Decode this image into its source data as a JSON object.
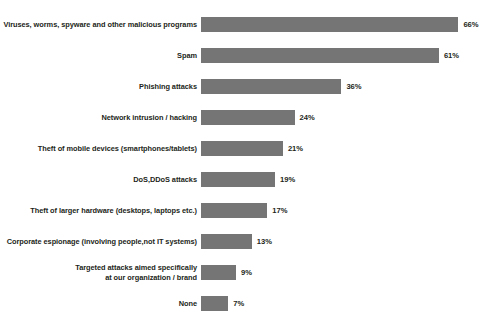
{
  "chart_data": {
    "type": "bar",
    "orientation": "horizontal",
    "title": "",
    "subtitle": "",
    "xlabel": "",
    "ylabel": "",
    "xlim": [
      0,
      70
    ],
    "grid": false,
    "legend": false,
    "value_suffix": "%",
    "bar_color": "#757575",
    "text_color": "#231f20",
    "background_color": "#ffffff",
    "categories": [
      "Viruses, worms, spyware and other malicious programs",
      "Spam",
      "Phishing attacks",
      "Network intrusion / hacking",
      "Theft of mobile devices (smartphones/tablets)",
      "DoS,DDoS attacks",
      "Theft of larger hardware (desktops, laptops etc.)",
      "Corporate espionage (involving people,not IT systems)",
      "Targeted attacks aimed specifically\nat our organization / brand",
      "None"
    ],
    "values": [
      66,
      61,
      36,
      24,
      21,
      19,
      17,
      13,
      9,
      7
    ],
    "value_labels": [
      "66%",
      "61%",
      "36%",
      "24%",
      "21%",
      "19%",
      "17%",
      "13%",
      "9%",
      "7%"
    ],
    "rows": [
      {
        "label": "Viruses, worms, spyware and other malicious programs",
        "value": 66,
        "value_label": "66%"
      },
      {
        "label": "Spam",
        "value": 61,
        "value_label": "61%"
      },
      {
        "label": "Phishing attacks",
        "value": 36,
        "value_label": "36%"
      },
      {
        "label": "Network intrusion / hacking",
        "value": 24,
        "value_label": "24%"
      },
      {
        "label": "Theft of mobile devices (smartphones/tablets)",
        "value": 21,
        "value_label": "21%"
      },
      {
        "label": "DoS,DDoS attacks",
        "value": 19,
        "value_label": "19%"
      },
      {
        "label": "Theft of larger hardware (desktops, laptops etc.)",
        "value": 17,
        "value_label": "17%"
      },
      {
        "label": "Corporate espionage (involving people,not IT systems)",
        "value": 13,
        "value_label": "13%"
      },
      {
        "label": "Targeted attacks aimed specifically\nat our organization / brand",
        "value": 9,
        "value_label": "9%"
      },
      {
        "label": "None",
        "value": 7,
        "value_label": "7%"
      }
    ]
  },
  "layout": {
    "bar_start_x": 205,
    "px_per_unit": 3.9,
    "row_pitch": 31,
    "first_row_top": 9,
    "bar_height": 15
  }
}
